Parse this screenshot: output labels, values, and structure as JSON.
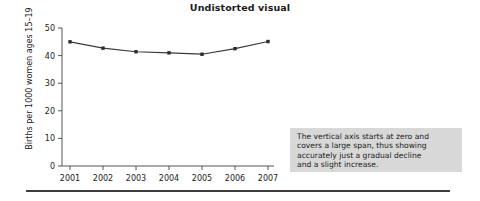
{
  "chart_data": {
    "type": "line",
    "title": "Undistorted visual",
    "xlabel": "",
    "ylabel": "Births per 1000 women ages 15–19",
    "categories": [
      "2001",
      "2002",
      "2003",
      "2004",
      "2005",
      "2006",
      "2007"
    ],
    "values": [
      45.0,
      42.7,
      41.4,
      41.0,
      40.5,
      42.5,
      45.1
    ],
    "series": [
      {
        "name": "Births per 1000 women ages 15–19",
        "values": [
          45.0,
          42.7,
          41.4,
          41.0,
          40.5,
          42.5,
          45.1
        ]
      }
    ],
    "ylim": [
      0,
      50
    ],
    "yticks": [
      "0",
      "10",
      "20",
      "30",
      "40",
      "50"
    ],
    "ytick_values": [
      0,
      10,
      20,
      30,
      40,
      50
    ],
    "grid": false,
    "legend": "none",
    "marker": "filled-square",
    "line_color": "#3a3a3a",
    "marker_color": "#2b2b2b",
    "axis_color": "#555555"
  },
  "annotation": {
    "text": "The vertical axis starts at zero and\ncovers a large span, thus showing\naccurately just a gradual decline\nand a slight increase.",
    "background_color": "#d8d8d8"
  },
  "page": {
    "background_color": "#ffffff",
    "rule_color": "#3d3d3d"
  }
}
